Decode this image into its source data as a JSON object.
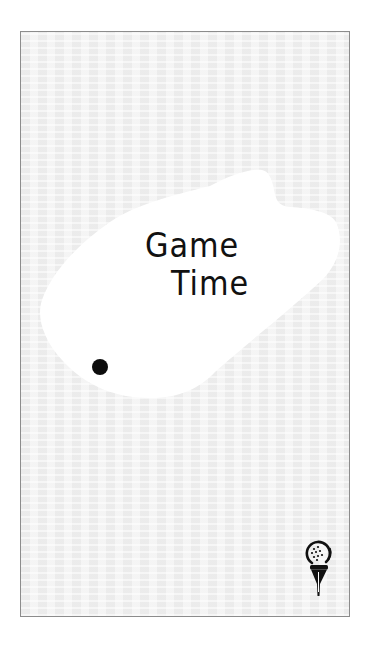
{
  "card": {
    "title_line_1": "Game",
    "title_line_2": "Time"
  },
  "decorations": {
    "blob": "white-splash-shape",
    "dot": "black-dot",
    "icon": "golf-ball-on-tee-icon"
  },
  "colors": {
    "page_background": "#ffffff",
    "card_background": "#f1f1f1",
    "card_border": "#8c8c8c",
    "blob_fill": "#ffffff",
    "ink": "#111111"
  }
}
